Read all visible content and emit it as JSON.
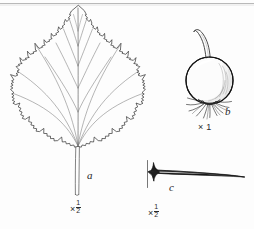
{
  "plate": {
    "title": "Botanical line illustration plate",
    "background_color": "#fdfdfd",
    "ink_color": "#1a1a1a",
    "width": 254,
    "height": 229,
    "top_rule_color": "#b9b9b9"
  },
  "figures": [
    {
      "key": "a",
      "label": "a",
      "subject": "leaf",
      "description": "Ovate, shallowly three-lobed leaf with doubly serrate margin, pinnate venation and a long slender petiole",
      "scale_text": "×½",
      "scale_multiplier": "×",
      "scale_numerator": "1",
      "scale_denominator": "2"
    },
    {
      "key": "b",
      "label": "b",
      "subject": "fruit",
      "description": "Globose fruit (hip) with curved pedicel above and persistent radiating sepals and bristles at the base",
      "scale_text": "× 1",
      "scale_multiplier": "×",
      "scale_numerator": "1",
      "scale_denominator": ""
    },
    {
      "key": "c",
      "label": "c",
      "subject": "thorn",
      "description": "Long straight thorn tapering to a fine point, broad flared base attached to a stem segment",
      "scale_text": "×½",
      "scale_multiplier": "×",
      "scale_numerator": "1",
      "scale_denominator": "2"
    }
  ]
}
